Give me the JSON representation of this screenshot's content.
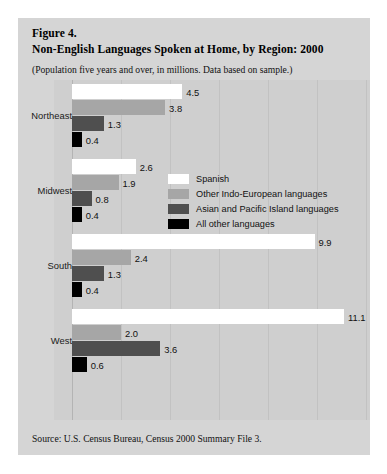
{
  "figure": {
    "label": "Figure 4.",
    "title": "Non-English Languages Spoken at Home, by Region: 2000",
    "subtitle": "(Population five years and over, in millions. Data based on sample.)",
    "source": "Source: U.S. Census Bureau, Census 2000 Summary File 3."
  },
  "colors": {
    "panel_background": "#d5d5d5",
    "plot_background": "#cfcfcf",
    "gridline": "#c2c2c2",
    "series_spanish": "#ffffff",
    "series_indo_european": "#a6a6a6",
    "series_asian_pacific": "#4f4f4f",
    "series_all_other": "#000000"
  },
  "chart_data": {
    "type": "bar",
    "orientation": "horizontal",
    "title": "Non-English Languages Spoken at Home, by Region: 2000",
    "subtitle": "(Population five years and over, in millions. Data based on sample.)",
    "xlabel": "",
    "ylabel": "",
    "xlim": [
      0,
      12
    ],
    "grid": true,
    "legend_position": "middle-center",
    "source": "Source: U.S. Census Bureau, Census 2000 Summary File 3.",
    "categories": [
      "Northeast",
      "Midwest",
      "South",
      "West"
    ],
    "series": [
      {
        "name": "Spanish",
        "color": "#ffffff",
        "values": [
          4.5,
          2.6,
          9.9,
          11.1
        ],
        "labels": [
          "4.5",
          "2.6",
          "9.9",
          "11.1"
        ]
      },
      {
        "name": "Other Indo-European languages",
        "color": "#a6a6a6",
        "values": [
          3.8,
          1.9,
          2.4,
          2.0
        ],
        "labels": [
          "3.8",
          "1.9",
          "2.4",
          "2.0"
        ]
      },
      {
        "name": "Asian and Pacific Island languages",
        "color": "#4f4f4f",
        "values": [
          1.3,
          0.8,
          1.3,
          3.6
        ],
        "labels": [
          "1.3",
          "0.8",
          "1.3",
          "3.6"
        ]
      },
      {
        "name": "All other languages",
        "color": "#000000",
        "values": [
          0.4,
          0.4,
          0.4,
          0.6
        ],
        "labels": [
          "0.4",
          "0.4",
          "0.4",
          "0.6"
        ]
      }
    ]
  }
}
